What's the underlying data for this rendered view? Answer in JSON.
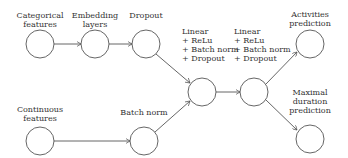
{
  "diagram": {
    "nodes": [
      {
        "id": "categorical",
        "label": "Categorical\nfeatures",
        "cx": 40,
        "cy": 44
      },
      {
        "id": "embedding",
        "label": "Embedding\nlayers",
        "cx": 95,
        "cy": 44
      },
      {
        "id": "dropout",
        "label": "Dropout",
        "cx": 146,
        "cy": 44
      },
      {
        "id": "continuous",
        "label": "Continuous\nfeatures",
        "cx": 40,
        "cy": 141
      },
      {
        "id": "batchnorm",
        "label": "Batch norm",
        "cx": 144,
        "cy": 141
      },
      {
        "id": "linear1",
        "label": "Linear\n+ ReLu\n+ Batch norm\n+ Dropout",
        "cx": 202,
        "cy": 92
      },
      {
        "id": "linear2",
        "label": "Linear\n+ ReLu\n+ Batch norm\n+ Dropout",
        "cx": 254,
        "cy": 92
      },
      {
        "id": "activities",
        "label": "Activities\nprediction",
        "cx": 310,
        "cy": 44
      },
      {
        "id": "duration",
        "label": "Maximal\nduration\nprediction",
        "cx": 310,
        "cy": 139
      }
    ],
    "edges": [
      [
        "categorical",
        "embedding"
      ],
      [
        "embedding",
        "dropout"
      ],
      [
        "dropout",
        "linear1"
      ],
      [
        "continuous",
        "batchnorm"
      ],
      [
        "batchnorm",
        "linear1"
      ],
      [
        "linear1",
        "linear2"
      ],
      [
        "linear2",
        "activities"
      ],
      [
        "linear2",
        "duration"
      ]
    ],
    "colors": {
      "stroke": "#555555",
      "text": "#333333"
    }
  }
}
